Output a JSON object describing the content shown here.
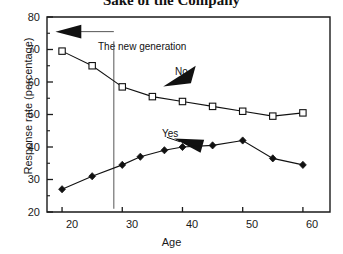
{
  "chart_data": {
    "type": "line",
    "title": "Sake of the Company",
    "xlabel": "Age",
    "ylabel": "Response rate (percentage)",
    "xlim": [
      17.5,
      64.5
    ],
    "ylim": [
      20,
      80
    ],
    "xticks": [
      "20",
      "30",
      "40",
      "50",
      "60"
    ],
    "xtick_values": [
      20,
      30,
      40,
      50,
      60
    ],
    "yticks": [
      "20",
      "30",
      "40",
      "50",
      "60",
      "70",
      "80"
    ],
    "ytick_values": [
      20,
      30,
      40,
      50,
      60,
      70,
      80
    ],
    "yminor_values": [
      25,
      35,
      45,
      55,
      65,
      75
    ],
    "grid": false,
    "legend": "none",
    "series": [
      {
        "name": "No",
        "marker": "open-square",
        "x": [
          20,
          25,
          30,
          35,
          40,
          45,
          50,
          55,
          60
        ],
        "values": [
          69.5,
          65,
          58.5,
          55.5,
          54,
          52.5,
          51,
          49.5,
          50.5
        ]
      },
      {
        "name": "Yes",
        "marker": "filled-diamond",
        "x": [
          20,
          25,
          30,
          33,
          37,
          40,
          45,
          50,
          55,
          60
        ],
        "values": [
          27,
          31,
          34.5,
          37,
          39,
          40,
          40.5,
          42,
          36.5,
          34.5
        ]
      }
    ],
    "annotations": [
      {
        "text": "The new generation",
        "x": 28.5,
        "y": 70.5
      },
      {
        "text": "No",
        "x": 42.5,
        "y": 63.5
      },
      {
        "text": "Yes",
        "x": 36.5,
        "y": 43.5
      }
    ]
  }
}
